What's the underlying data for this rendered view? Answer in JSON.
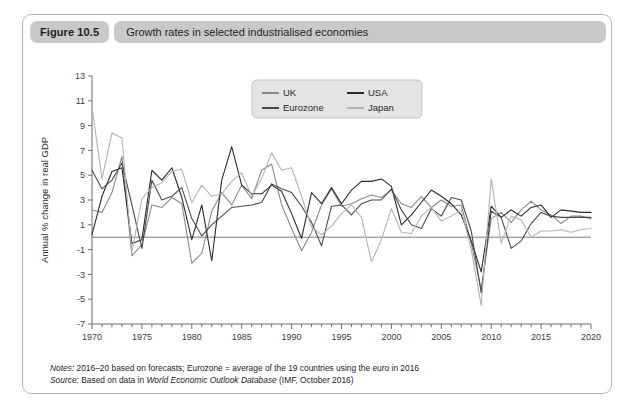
{
  "figure": {
    "number_label": "Figure 10.5",
    "caption": "Growth rates in selected industrialised economies"
  },
  "footer": {
    "notes_label": "Notes:",
    "notes_text": " 2016–20 based on forecasts; Eurozone = average of the 19 countries using the euro in 2016",
    "source_label": "Source:",
    "source_pre": " Based on data in ",
    "source_italic": "World Economic Outlook Database",
    "source_post": " (IMF, October 2016)"
  },
  "legend": {
    "entries": [
      {
        "label": "UK",
        "color": "#8a8a8a"
      },
      {
        "label": "USA",
        "color": "#2b2b2b"
      },
      {
        "label": "Eurozone",
        "color": "#4a4a4a"
      },
      {
        "label": "Japan",
        "color": "#b4b4b4"
      }
    ]
  },
  "chart_data": {
    "type": "line",
    "title": "Growth rates in selected industrialised economies",
    "xlabel": "",
    "ylabel": "Annual % change in real GDP",
    "xlim": [
      1970,
      2020
    ],
    "ylim": [
      -7,
      13
    ],
    "ytick_values": [
      13,
      11,
      9,
      7,
      5,
      3,
      1,
      -1,
      -3,
      -5,
      -7
    ],
    "ytick_labels": [
      "13",
      "11",
      "9",
      "7",
      "5",
      "3",
      "1",
      "-1",
      "-3",
      "-5",
      "-7"
    ],
    "xtick_values": [
      1970,
      1975,
      1980,
      1985,
      1990,
      1995,
      2000,
      2005,
      2010,
      2015,
      2020
    ],
    "xtick_labels": [
      "1970",
      "1975",
      "1980",
      "1985",
      "1990",
      "1995",
      "2000",
      "2005",
      "2010",
      "2015",
      "2020"
    ],
    "minor_xtick_step": 1,
    "grid": false,
    "zero_line": true,
    "legend_position": "top-center",
    "x": [
      1970,
      1971,
      1972,
      1973,
      1974,
      1975,
      1976,
      1977,
      1978,
      1979,
      1980,
      1981,
      1982,
      1983,
      1984,
      1985,
      1986,
      1987,
      1988,
      1989,
      1990,
      1991,
      1992,
      1993,
      1994,
      1995,
      1996,
      1997,
      1998,
      1999,
      2000,
      2001,
      2002,
      2003,
      2004,
      2005,
      2006,
      2007,
      2008,
      2009,
      2010,
      2011,
      2012,
      2013,
      2014,
      2015,
      2016,
      2017,
      2018,
      2019,
      2020
    ],
    "series": [
      {
        "name": "UK",
        "color": "#8a8a8a",
        "values": [
          2.2,
          2.0,
          3.6,
          6.5,
          -1.5,
          -0.6,
          2.6,
          2.4,
          3.2,
          2.7,
          -2.1,
          -1.3,
          2.1,
          3.6,
          2.6,
          4.2,
          3.1,
          5.4,
          5.9,
          2.6,
          0.7,
          -1.1,
          0.4,
          2.6,
          3.9,
          2.5,
          2.7,
          3.1,
          3.4,
          3.2,
          3.8,
          2.7,
          2.4,
          3.3,
          2.4,
          3.0,
          2.5,
          2.6,
          -0.5,
          -4.2,
          1.5,
          2.0,
          1.2,
          2.2,
          2.9,
          2.2,
          1.8,
          1.1,
          1.7,
          1.7,
          1.5
        ]
      },
      {
        "name": "USA",
        "color": "#2b2b2b",
        "values": [
          0.2,
          3.3,
          5.3,
          5.6,
          -0.5,
          -0.2,
          5.4,
          4.6,
          5.6,
          3.2,
          -0.2,
          2.6,
          -1.9,
          4.6,
          7.3,
          4.2,
          3.5,
          3.5,
          4.2,
          3.7,
          1.9,
          -0.1,
          3.6,
          2.7,
          4.0,
          2.7,
          3.8,
          4.5,
          4.5,
          4.7,
          4.1,
          1.0,
          1.8,
          2.8,
          3.8,
          3.3,
          2.7,
          1.8,
          -0.3,
          -2.8,
          2.5,
          1.6,
          2.2,
          1.7,
          2.4,
          2.6,
          1.6,
          2.2,
          2.1,
          2.0,
          2.0
        ]
      },
      {
        "name": "Eurozone",
        "color": "#4a4a4a",
        "values": [
          5.4,
          3.9,
          4.6,
          6.0,
          2.6,
          -0.9,
          4.6,
          3.0,
          3.3,
          4.0,
          1.5,
          0.1,
          1.0,
          1.7,
          2.4,
          2.5,
          2.6,
          2.8,
          4.3,
          3.9,
          3.6,
          2.5,
          1.2,
          -0.7,
          2.5,
          2.6,
          1.8,
          2.7,
          3.0,
          3.0,
          3.9,
          2.2,
          1.0,
          0.7,
          2.3,
          1.7,
          3.2,
          3.0,
          0.5,
          -4.5,
          2.1,
          1.6,
          -0.9,
          -0.3,
          1.1,
          2.0,
          1.7,
          1.6,
          1.6,
          1.6,
          1.6
        ]
      },
      {
        "name": "Japan",
        "color": "#b4b4b4",
        "values": [
          10.5,
          4.7,
          8.4,
          8.0,
          -1.2,
          3.1,
          4.0,
          4.4,
          5.3,
          5.5,
          2.8,
          4.2,
          3.3,
          3.5,
          4.5,
          5.2,
          3.3,
          4.7,
          6.8,
          5.4,
          5.6,
          3.3,
          0.8,
          0.2,
          0.9,
          1.9,
          2.6,
          1.6,
          -2.0,
          -0.2,
          2.3,
          0.4,
          0.3,
          1.7,
          2.4,
          1.3,
          1.7,
          2.2,
          -1.0,
          -5.5,
          4.7,
          -0.5,
          1.7,
          1.4,
          0.0,
          0.5,
          0.5,
          0.6,
          0.4,
          0.6,
          0.7
        ]
      }
    ]
  }
}
